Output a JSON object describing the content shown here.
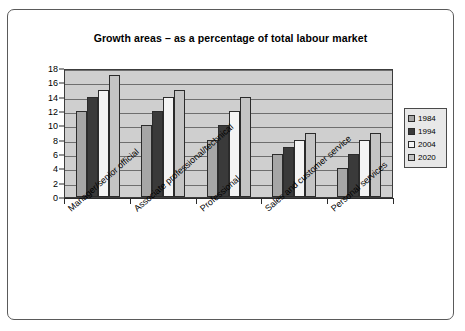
{
  "chart_data": {
    "type": "bar",
    "title": "Growth areas – as a percentage of total labour market",
    "xlabel": "",
    "ylabel": "",
    "ylim": [
      0,
      18
    ],
    "ytick_step": 2,
    "yticks": [
      "18",
      "16",
      "14",
      "12",
      "10",
      "8",
      "6",
      "4",
      "2",
      "0"
    ],
    "grid": true,
    "legend_position": "right",
    "categories": [
      "Manager/senior official",
      "Associate professional/technical",
      "Professional",
      "Sales and customer service",
      "Personal services"
    ],
    "series": [
      {
        "name": "1984",
        "color": "#a6a6a6",
        "values": [
          12,
          10,
          8,
          6,
          4
        ]
      },
      {
        "name": "1994",
        "color": "#3a3a3a",
        "values": [
          14,
          12,
          10,
          7,
          6
        ]
      },
      {
        "name": "2004",
        "color": "#f4f4f4",
        "values": [
          15,
          14,
          12,
          8,
          8
        ]
      },
      {
        "name": "2020",
        "color": "#c4c4c4",
        "values": [
          17,
          15,
          14,
          9,
          9
        ]
      }
    ]
  }
}
